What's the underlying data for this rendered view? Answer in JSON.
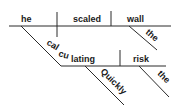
{
  "diagram": {
    "type": "sentence-diagram",
    "sentence": "Quickly calculating the risk, he scaled the wall",
    "subject": "he",
    "verb": "scaled",
    "direct_object": "wall",
    "object_modifier": "the",
    "participle": "calculating",
    "participle_modifier": "Quickly",
    "participle_object": "risk",
    "participle_object_modifier": "the",
    "line_color": "#2a2a2a",
    "text_color": "#1a1a1a"
  }
}
